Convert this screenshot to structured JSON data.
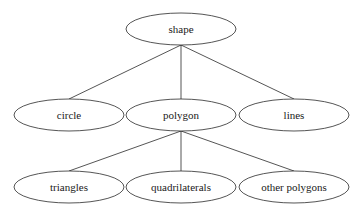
{
  "diagram": {
    "type": "tree",
    "nodes": [
      {
        "id": "shape",
        "label": "shape",
        "cx": 181,
        "cy": 29,
        "rx": 55,
        "ry": 16
      },
      {
        "id": "circle",
        "label": "circle",
        "cx": 69,
        "cy": 115,
        "rx": 55,
        "ry": 16
      },
      {
        "id": "polygon",
        "label": "polygon",
        "cx": 181,
        "cy": 115,
        "rx": 55,
        "ry": 16
      },
      {
        "id": "lines",
        "label": "lines",
        "cx": 294,
        "cy": 115,
        "rx": 55,
        "ry": 16
      },
      {
        "id": "triangles",
        "label": "triangles",
        "cx": 69,
        "cy": 187,
        "rx": 55,
        "ry": 16
      },
      {
        "id": "quadrilaterals",
        "label": "quadrilaterals",
        "cx": 181,
        "cy": 187,
        "rx": 55,
        "ry": 16
      },
      {
        "id": "other_polygons",
        "label": "other polygons",
        "cx": 294,
        "cy": 187,
        "rx": 55,
        "ry": 16
      }
    ],
    "edges": [
      {
        "from": "shape",
        "to": "circle",
        "x1": 181,
        "y1": 45,
        "x2": 69,
        "y2": 99
      },
      {
        "from": "shape",
        "to": "polygon",
        "x1": 181,
        "y1": 45,
        "x2": 181,
        "y2": 99
      },
      {
        "from": "shape",
        "to": "lines",
        "x1": 181,
        "y1": 45,
        "x2": 294,
        "y2": 99
      },
      {
        "from": "polygon",
        "to": "triangles",
        "x1": 181,
        "y1": 131,
        "x2": 69,
        "y2": 171
      },
      {
        "from": "polygon",
        "to": "quadrilaterals",
        "x1": 181,
        "y1": 131,
        "x2": 181,
        "y2": 171
      },
      {
        "from": "polygon",
        "to": "other_polygons",
        "x1": 181,
        "y1": 131,
        "x2": 294,
        "y2": 171
      }
    ]
  }
}
